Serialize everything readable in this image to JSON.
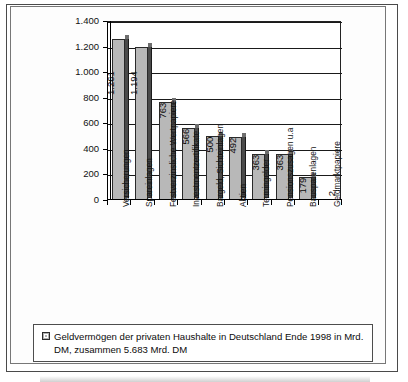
{
  "chart_data": {
    "type": "bar",
    "title": "",
    "subtitle": "",
    "xlabel": "",
    "ylabel": "",
    "ylim": [
      0,
      1400
    ],
    "ytick_values": [
      0,
      200,
      400,
      600,
      800,
      1000,
      1200,
      1400
    ],
    "ytick_labels": [
      "0",
      "200",
      "400",
      "600",
      "800",
      "1.000",
      "1.200",
      "1.400"
    ],
    "grid": true,
    "legend_position": "bottom",
    "categories": [
      "Versicherungen",
      "Spareinlagen",
      "Festverzinsliche Wertpapiere",
      "Investmentzertifikate",
      "Bargeld, Sichteinlagen",
      "Aktien",
      "Termingelder",
      "Pensionszusagen u.a",
      "Bausparenlagen",
      "Geldmarktpapiere"
    ],
    "values": [
      1261,
      1194,
      763,
      566,
      500,
      492,
      363,
      363,
      179,
      2
    ],
    "value_labels": [
      "1.261",
      "1.194",
      "763",
      "566",
      "500",
      "492",
      "363",
      "363",
      "179",
      "2"
    ],
    "series": [
      {
        "name": "Geldvermögen der privaten Haushalte in Deutschland Ende 1998 in Mrd. DM, zusammen 5.683 Mrd. DM",
        "values": [
          1261,
          1194,
          763,
          566,
          500,
          492,
          363,
          363,
          179,
          2
        ]
      }
    ],
    "legend": [
      "Geldvermögen der privaten Haushalte in Deutschland Ende 1998 in Mrd. DM, zusammen 5.683 Mrd. DM"
    ],
    "units": "Mrd. DM",
    "total": "5.683 Mrd. DM",
    "colors": {
      "bar_fill": "#b8b8b8",
      "bar_side": "#4a4a4a",
      "bar_outline": "#2a2a2a",
      "grid": "#1a1a1a",
      "text": "#0c0c0c",
      "frame": "#4a4a4a",
      "background": "#ffffff"
    }
  },
  "legend": {
    "swatch_name": "legend-color-swatch",
    "text": "Geldvermögen der privaten Haushalte in Deutschland Ende 1998 in Mrd. DM, zusammen 5.683 Mrd. DM"
  }
}
